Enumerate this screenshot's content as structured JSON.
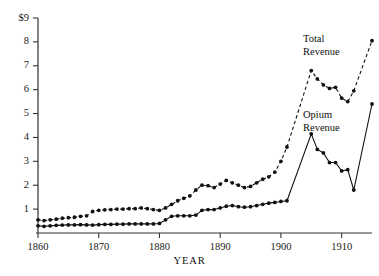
{
  "chart_data": {
    "type": "line",
    "title": "",
    "xlabel": "YEAR",
    "ylabel": "",
    "xlim": [
      1860,
      1915
    ],
    "ylim": [
      0,
      9
    ],
    "grid": false,
    "legend_position": "inline-annotation",
    "y_tick_labels": [
      "$9",
      "8",
      "7",
      "6",
      "5",
      "4",
      "3",
      "2",
      "1"
    ],
    "y_ticks": [
      9,
      8,
      7,
      6,
      5,
      4,
      3,
      2,
      1
    ],
    "x_ticks": [
      1860,
      1870,
      1880,
      1890,
      1900,
      1910
    ],
    "x_tick_labels": [
      "1860",
      "1870",
      "1880",
      "1890",
      "1900",
      "1910"
    ],
    "annotations": [
      {
        "name": "total-revenue-label",
        "text_line1": "Total",
        "text_line2": "Revenue"
      },
      {
        "name": "opium-revenue-label",
        "text_line1": "Opium",
        "text_line2": "Revenue"
      }
    ],
    "series": [
      {
        "name": "Total Revenue",
        "style": "dashed",
        "marker": "filled-circle",
        "x": [
          1860,
          1861,
          1862,
          1863,
          1864,
          1865,
          1866,
          1867,
          1868,
          1869,
          1870,
          1871,
          1872,
          1873,
          1874,
          1875,
          1876,
          1877,
          1878,
          1879,
          1880,
          1881,
          1882,
          1883,
          1884,
          1885,
          1886,
          1887,
          1888,
          1889,
          1890,
          1891,
          1892,
          1893,
          1894,
          1895,
          1896,
          1897,
          1898,
          1899,
          1900,
          1901,
          1905,
          1906,
          1907,
          1908,
          1909,
          1910,
          1911,
          1912,
          1915
        ],
        "values": [
          0.55,
          0.52,
          0.55,
          0.58,
          0.62,
          0.64,
          0.66,
          0.7,
          0.72,
          0.9,
          0.95,
          0.97,
          0.98,
          1.0,
          1.0,
          1.02,
          1.02,
          1.05,
          1.02,
          0.98,
          0.95,
          1.05,
          1.2,
          1.35,
          1.45,
          1.55,
          1.8,
          2.0,
          1.98,
          1.9,
          2.05,
          2.2,
          2.1,
          2.0,
          1.9,
          1.95,
          2.1,
          2.25,
          2.35,
          2.55,
          3.0,
          3.6,
          6.8,
          6.45,
          6.2,
          6.05,
          6.1,
          5.65,
          5.5,
          5.95,
          8.05
        ]
      },
      {
        "name": "Opium Revenue",
        "style": "solid",
        "marker": "filled-circle",
        "x": [
          1860,
          1861,
          1862,
          1863,
          1864,
          1865,
          1866,
          1867,
          1868,
          1869,
          1870,
          1871,
          1872,
          1873,
          1874,
          1875,
          1876,
          1877,
          1878,
          1879,
          1880,
          1881,
          1882,
          1883,
          1884,
          1885,
          1886,
          1887,
          1888,
          1889,
          1890,
          1891,
          1892,
          1893,
          1894,
          1895,
          1896,
          1897,
          1898,
          1899,
          1900,
          1901,
          1905,
          1906,
          1907,
          1908,
          1909,
          1910,
          1911,
          1912,
          1915
        ],
        "values": [
          0.3,
          0.28,
          0.3,
          0.32,
          0.33,
          0.34,
          0.34,
          0.35,
          0.34,
          0.33,
          0.35,
          0.36,
          0.36,
          0.37,
          0.37,
          0.38,
          0.38,
          0.38,
          0.38,
          0.38,
          0.4,
          0.55,
          0.7,
          0.72,
          0.72,
          0.72,
          0.75,
          0.95,
          0.98,
          0.98,
          1.05,
          1.12,
          1.15,
          1.1,
          1.08,
          1.1,
          1.15,
          1.2,
          1.25,
          1.28,
          1.32,
          1.35,
          4.15,
          3.5,
          3.35,
          2.95,
          2.95,
          2.6,
          2.65,
          1.8,
          5.4
        ]
      }
    ]
  }
}
